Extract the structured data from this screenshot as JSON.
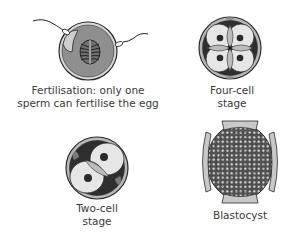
{
  "diagram": {
    "panels": [
      {
        "id": "fertilisation",
        "label_lines": [
          "Fertilisation: only one",
          "sperm can fertilise the egg"
        ],
        "elements": [
          "egg",
          "nucleus-spindle",
          "sperm-entering",
          "sperm-approaching"
        ]
      },
      {
        "id": "four-cell",
        "label_lines": [
          "Four-cell",
          "stage"
        ],
        "elements": [
          "zona",
          "four-cells",
          "four-nuclei"
        ]
      },
      {
        "id": "two-cell",
        "label_lines": [
          "Two-cell",
          "stage"
        ],
        "elements": [
          "zona",
          "two-cells",
          "two-nuclei"
        ]
      },
      {
        "id": "blastocyst",
        "label_lines": [
          "Blastocyst"
        ],
        "elements": [
          "cell-mass",
          "shell-fragments"
        ]
      }
    ],
    "colors": {
      "outline": "#2a2a2a",
      "zona": "#9a9a9a",
      "egg_cytoplasm": "#8f8f8f",
      "cell_fill": "#e6e6e6",
      "overlap": "#bdbdbd",
      "nucleus": "#2a2a2a",
      "text": "#3a3a3a"
    }
  }
}
